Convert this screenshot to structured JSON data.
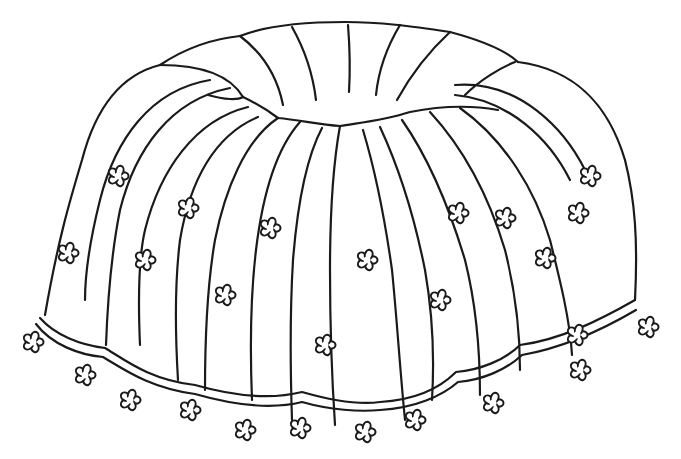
{
  "illustration": {
    "subject": "Bundt cake coloring page line drawing decorated with small five-petal flowers",
    "background_color": "#ffffff",
    "line_color": "#1a1a1a",
    "flower_count_on_cake": 17,
    "flower_count_around_base": 14
  }
}
